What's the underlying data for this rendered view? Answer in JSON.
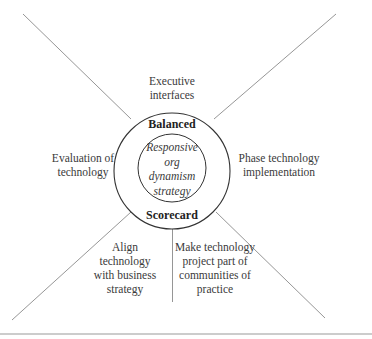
{
  "diagram": {
    "center": {
      "outer_top_label": "Balanced",
      "outer_bottom_label": "Scorecard",
      "inner_label": "Responsive\norg\ndynamism\nstrategy"
    },
    "spokes": [
      {
        "id": "top",
        "label": "Executive\ninterfaces"
      },
      {
        "id": "left",
        "label": "Evaluation of\ntechnology"
      },
      {
        "id": "right",
        "label": "Phase technology\nimplementation"
      },
      {
        "id": "bottom-left",
        "label": "Align\ntechnology\nwith business\nstrategy"
      },
      {
        "id": "bottom-right",
        "label": "Make technology\nproject part of\ncommunities of\npractice"
      }
    ],
    "colors": {
      "line": "#8a8a8a",
      "circle": "#333333",
      "text": "#3a3a3a",
      "rule": "#9a9a9a"
    }
  }
}
